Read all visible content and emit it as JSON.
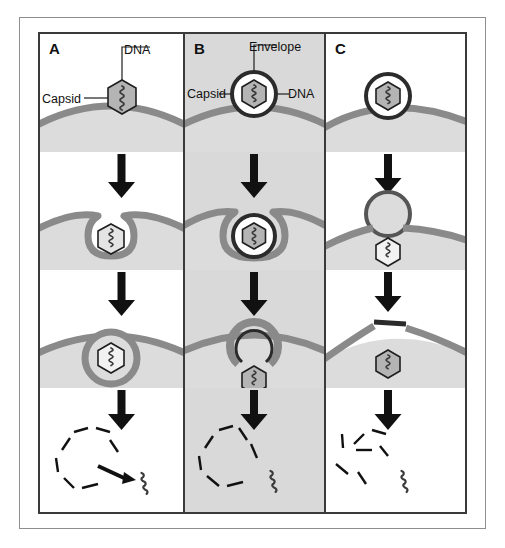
{
  "figure": {
    "panels": [
      {
        "id": "A",
        "letter": "A",
        "background": "#ffffff",
        "entry_route": "receptor-mediated endocytosis of naked capsid",
        "labels": [
          {
            "name": "dna",
            "text": "DNA"
          },
          {
            "name": "capsid",
            "text": "Capsid"
          }
        ],
        "stages": [
          {
            "name": "attachment",
            "description": "naked capsid with DNA binds cell surface"
          },
          {
            "name": "invagination",
            "description": "plasma membrane invaginates around capsid"
          },
          {
            "name": "vesicle",
            "description": "capsid enclosed in endocytic vesicle"
          },
          {
            "name": "uncoating",
            "description": "capsid dissociates and releases DNA"
          }
        ]
      },
      {
        "id": "B",
        "letter": "B",
        "background": "#d9d9d9",
        "entry_route": "endocytosis of enveloped virion with endosomal fusion",
        "labels": [
          {
            "name": "envelope",
            "text": "Envelope"
          },
          {
            "name": "capsid",
            "text": "Capsid"
          },
          {
            "name": "dna",
            "text": "DNA"
          }
        ],
        "stages": [
          {
            "name": "attachment",
            "description": "enveloped virion binds cell surface"
          },
          {
            "name": "invagination",
            "description": "membrane invaginates around enveloped virion"
          },
          {
            "name": "fusion",
            "description": "envelope fuses with vesicle membrane releasing capsid"
          },
          {
            "name": "uncoating",
            "description": "capsid dissociates and releases DNA"
          }
        ]
      },
      {
        "id": "C",
        "letter": "C",
        "background": "#ffffff",
        "entry_route": "direct fusion of envelope with plasma membrane",
        "labels": [],
        "stages": [
          {
            "name": "attachment",
            "description": "enveloped virion binds cell surface"
          },
          {
            "name": "fusion",
            "description": "envelope fuses with plasma membrane, capsid enters cytoplasm"
          },
          {
            "name": "entry",
            "description": "capsid free in cytoplasm, fused patch in membrane"
          },
          {
            "name": "uncoating",
            "description": "capsid dissociates and releases DNA"
          }
        ]
      }
    ],
    "colors": {
      "membrane": "#8a8a8a",
      "cytoplasm": "#dcdcdc",
      "capsid_fill": "#b4b4b4",
      "capsid_stroke": "#1e1e1e",
      "envelope": "#2b2b2b",
      "arrow": "#111111",
      "panel_b_background": "#d9d9d9",
      "frame": "#3a3a3a",
      "outer_frame": "#8e8e8e"
    }
  }
}
